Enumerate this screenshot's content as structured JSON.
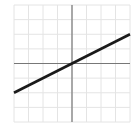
{
  "chart_data": {
    "type": "line",
    "title": "",
    "xlabel": "",
    "ylabel": "",
    "xlim": [
      -4,
      4
    ],
    "ylim": [
      -4,
      4
    ],
    "grid": true,
    "axes_through_origin": true,
    "series": [
      {
        "name": "y = 0.5x",
        "x": [
          -4,
          4
        ],
        "y": [
          -2,
          2
        ],
        "color": "#1a1a1a"
      }
    ]
  },
  "style": {
    "grid_color": "#e4e4e4",
    "axis_color": "#777777",
    "line_color": "#1a1a1a"
  }
}
